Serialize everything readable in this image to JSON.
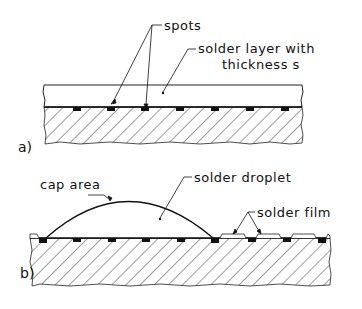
{
  "figure": {
    "panel_a": {
      "label": "a)",
      "annotations": {
        "spots": "spots",
        "solder_layer_line1": "solder layer with",
        "solder_layer_line2": "thickness  s"
      }
    },
    "panel_b": {
      "label": "b)",
      "annotations": {
        "cap_area": "cap area",
        "solder_droplet": "solder droplet",
        "solder_film": "solder film"
      }
    }
  }
}
